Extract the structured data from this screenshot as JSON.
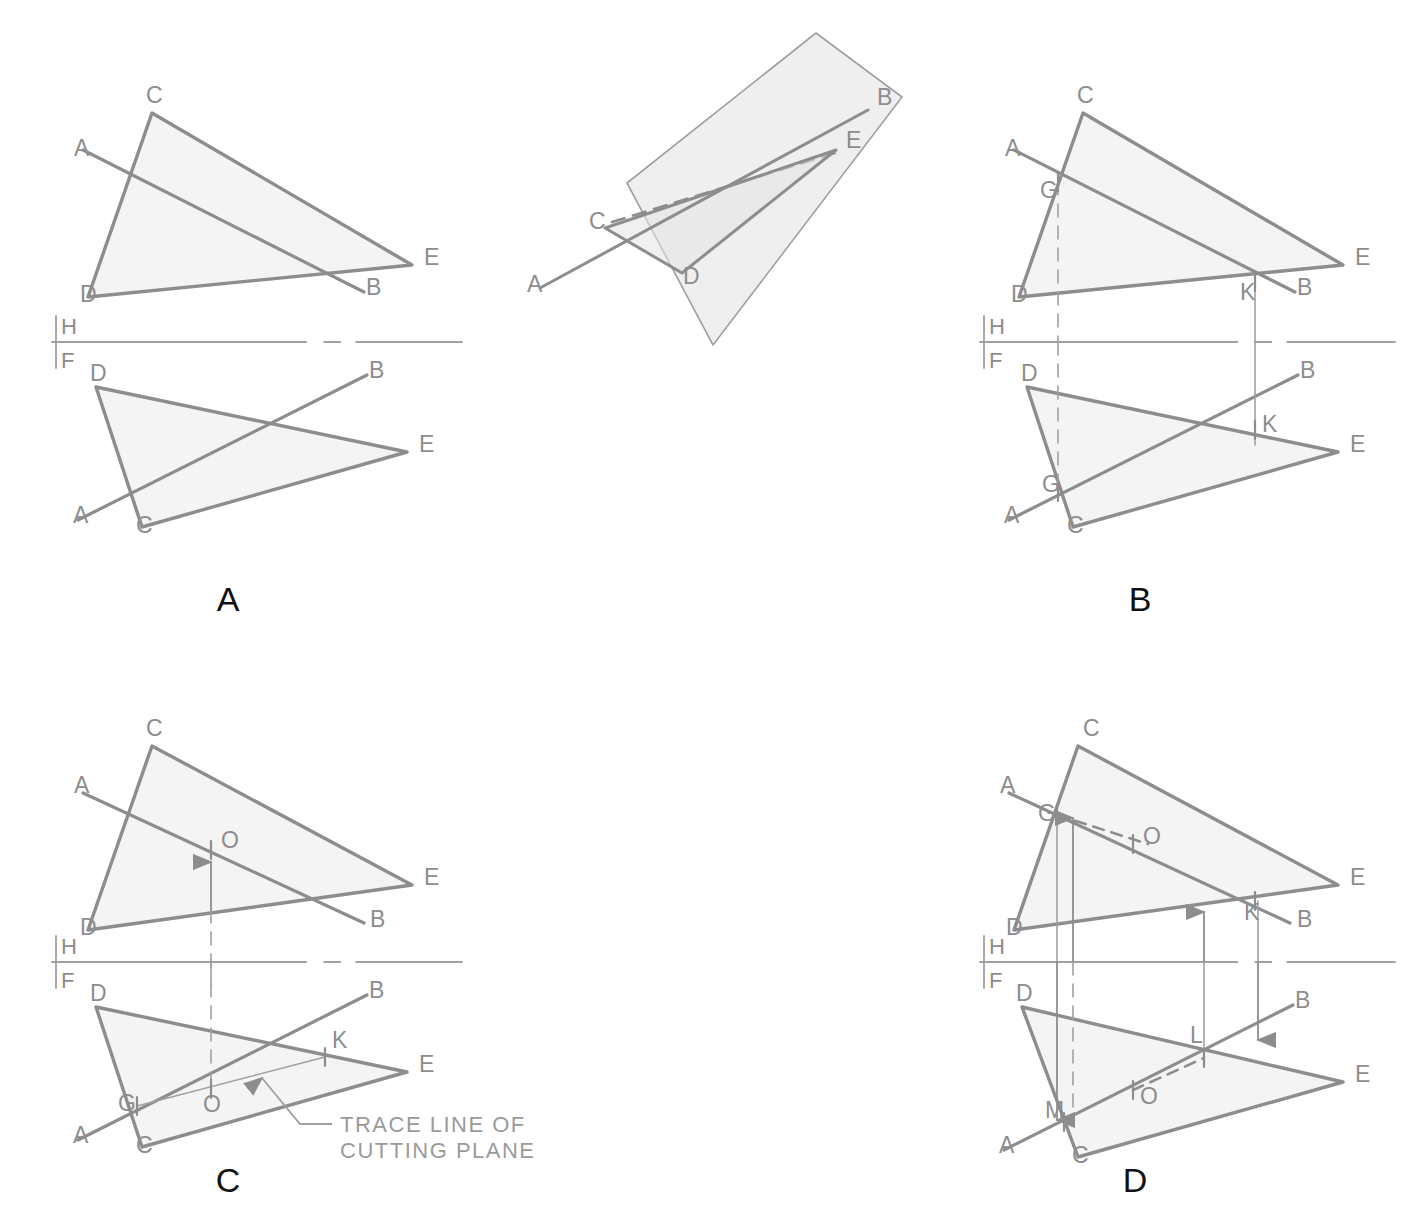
{
  "figure": {
    "stroke_color": "#8d8d8d",
    "thin_stroke_color": "#a0a0a0",
    "fill_color": "#f4f4f4",
    "plane_fill_color": "#efefef",
    "label_color": "#8d8d8d",
    "panel_label_color": "#111111",
    "background": "#ffffff"
  },
  "panels": [
    {
      "id": "panel-a",
      "label": "A",
      "label_pos": {
        "x": 228,
        "y": 611
      },
      "reference_line": {
        "h": "H",
        "f": "F",
        "y": 342,
        "x1": 52,
        "x2": 462
      },
      "top_view": {
        "name": "horizontal-view",
        "vertices": {
          "C": {
            "x": 152,
            "y": 113
          },
          "D": {
            "x": 88,
            "y": 297
          },
          "E": {
            "x": 412,
            "y": 265
          }
        },
        "line_ab": {
          "A": {
            "x": 83,
            "y": 150
          },
          "B": {
            "x": 364,
            "y": 292
          }
        },
        "labels": [
          {
            "t": "C",
            "x": 146,
            "y": 103
          },
          {
            "t": "A",
            "x": 74,
            "y": 156
          },
          {
            "t": "D",
            "x": 80,
            "y": 302
          },
          {
            "t": "E",
            "x": 424,
            "y": 265
          },
          {
            "t": "B",
            "x": 366,
            "y": 295
          }
        ]
      },
      "front_view": {
        "name": "frontal-view",
        "vertices": {
          "D": {
            "x": 96,
            "y": 387
          },
          "C": {
            "x": 142,
            "y": 527
          },
          "E": {
            "x": 407,
            "y": 452
          }
        },
        "line_ab": {
          "A": {
            "x": 78,
            "y": 520
          },
          "B": {
            "x": 367,
            "y": 375
          }
        },
        "labels": [
          {
            "t": "D",
            "x": 90,
            "y": 381
          },
          {
            "t": "B",
            "x": 369,
            "y": 378
          },
          {
            "t": "E",
            "x": 419,
            "y": 452
          },
          {
            "t": "A",
            "x": 73,
            "y": 523
          },
          {
            "t": "C",
            "x": 136,
            "y": 533
          }
        ]
      }
    },
    {
      "id": "panel-b",
      "label": "B",
      "label_pos": {
        "x": 1140,
        "y": 611
      },
      "reference_line": {
        "h": "H",
        "f": "F",
        "y": 342,
        "x1": 980,
        "x2": 1395
      },
      "top_view": {
        "name": "horizontal-view",
        "vertices": {
          "C": {
            "x": 1083,
            "y": 113
          },
          "D": {
            "x": 1019,
            "y": 297
          },
          "E": {
            "x": 1343,
            "y": 265
          }
        },
        "line_ab": {
          "A": {
            "x": 1014,
            "y": 150
          },
          "B": {
            "x": 1295,
            "y": 292
          }
        },
        "pierce_points": [
          {
            "t": "G",
            "x": 1058,
            "y": 182,
            "label_x": 1040,
            "label_y": 198
          },
          {
            "t": "K",
            "x": 1255,
            "y": 282,
            "label_x": 1240,
            "label_y": 300
          }
        ],
        "projectors": [
          {
            "x": 1058,
            "y1": 182,
            "y2": 342,
            "style": "dashed"
          },
          {
            "x": 1255,
            "y1": 282,
            "y2": 342,
            "style": "solid"
          }
        ],
        "labels": [
          {
            "t": "C",
            "x": 1077,
            "y": 103
          },
          {
            "t": "A",
            "x": 1005,
            "y": 156
          },
          {
            "t": "D",
            "x": 1011,
            "y": 302
          },
          {
            "t": "E",
            "x": 1355,
            "y": 265
          },
          {
            "t": "B",
            "x": 1297,
            "y": 295
          }
        ]
      },
      "front_view": {
        "name": "frontal-view",
        "vertices": {
          "D": {
            "x": 1027,
            "y": 387
          },
          "C": {
            "x": 1073,
            "y": 527
          },
          "E": {
            "x": 1338,
            "y": 452
          }
        },
        "line_ab": {
          "A": {
            "x": 1009,
            "y": 520
          },
          "B": {
            "x": 1298,
            "y": 375
          }
        },
        "marks": [
          {
            "t": "G",
            "x": 1058,
            "y": 492,
            "label_x": 1042,
            "label_y": 492
          },
          {
            "t": "K",
            "x": 1255,
            "y": 430,
            "label_x": 1262,
            "label_y": 432
          }
        ],
        "projectors": [
          {
            "x": 1058,
            "y1": 342,
            "y2": 500,
            "style": "dashed"
          },
          {
            "x": 1255,
            "y1": 342,
            "y2": 445,
            "style": "solid"
          }
        ],
        "labels": [
          {
            "t": "D",
            "x": 1021,
            "y": 381
          },
          {
            "t": "B",
            "x": 1300,
            "y": 378
          },
          {
            "t": "E",
            "x": 1350,
            "y": 452
          },
          {
            "t": "A",
            "x": 1004,
            "y": 523
          },
          {
            "t": "C",
            "x": 1067,
            "y": 533
          }
        ]
      }
    },
    {
      "id": "panel-c",
      "label": "C",
      "label_pos": {
        "x": 228,
        "y": 1192
      },
      "reference_line": {
        "h": "H",
        "f": "F",
        "y": 962,
        "x1": 52,
        "x2": 462
      },
      "top_view": {
        "name": "horizontal-view",
        "vertices": {
          "C": {
            "x": 152,
            "y": 746
          },
          "D": {
            "x": 88,
            "y": 930
          },
          "E": {
            "x": 412,
            "y": 885
          }
        },
        "line_ab": {
          "A": {
            "x": 83,
            "y": 793
          },
          "B": {
            "x": 364,
            "y": 923
          }
        },
        "point_o": {
          "x": 211,
          "y": 850,
          "label_x": 221,
          "label_y": 848
        },
        "arrow_up": {
          "x": 211,
          "y1": 910,
          "y2": 862
        },
        "projector": {
          "x": 211,
          "y1": 910,
          "y2": 985,
          "style": "dashed"
        },
        "labels": [
          {
            "t": "C",
            "x": 146,
            "y": 736
          },
          {
            "t": "A",
            "x": 74,
            "y": 793
          },
          {
            "t": "D",
            "x": 80,
            "y": 935
          },
          {
            "t": "E",
            "x": 424,
            "y": 885
          },
          {
            "t": "B",
            "x": 370,
            "y": 927
          },
          {
            "t": "O",
            "x": 221,
            "y": 848
          }
        ]
      },
      "front_view": {
        "name": "frontal-view",
        "vertices": {
          "D": {
            "x": 96,
            "y": 1007
          },
          "C": {
            "x": 142,
            "y": 1147
          },
          "E": {
            "x": 407,
            "y": 1072
          }
        },
        "line_ab": {
          "A": {
            "x": 78,
            "y": 1140
          },
          "B": {
            "x": 367,
            "y": 995
          }
        },
        "trace_line": {
          "G": {
            "x": 137,
            "y": 1106
          },
          "K": {
            "x": 325,
            "y": 1057
          }
        },
        "point_o": {
          "x": 211,
          "y": 1089,
          "label_x": 205,
          "label_y": 1110
        },
        "marks": [
          {
            "t": "G",
            "x": 137,
            "y": 1106,
            "label_x": 118,
            "label_y": 1111
          },
          {
            "t": "K",
            "x": 325,
            "y": 1057,
            "label_x": 332,
            "label_y": 1048
          },
          {
            "t": "O",
            "x": 211,
            "y": 1089,
            "label_x": 203,
            "label_y": 1112
          }
        ],
        "projector": {
          "x": 211,
          "y1": 962,
          "y2": 1089,
          "style": "dashed"
        },
        "annotation": {
          "text_line1": "TRACE  LINE  OF",
          "text_line2": "CUTTING PLANE",
          "text_x": 340,
          "text_y1": 1132,
          "text_y2": 1158,
          "leader": {
            "x1": 332,
            "y1": 1124,
            "x2": 300,
            "y2": 1124,
            "x3": 262,
            "y3": 1078
          },
          "arrow_tip": {
            "x": 257,
            "y": 1072
          }
        },
        "labels": [
          {
            "t": "D",
            "x": 90,
            "y": 1001
          },
          {
            "t": "B",
            "x": 369,
            "y": 998
          },
          {
            "t": "E",
            "x": 419,
            "y": 1072
          },
          {
            "t": "A",
            "x": 73,
            "y": 1143
          },
          {
            "t": "C",
            "x": 136,
            "y": 1153
          }
        ]
      }
    },
    {
      "id": "panel-d",
      "label": "D",
      "label_pos": {
        "x": 1135,
        "y": 1192
      },
      "reference_line": {
        "h": "H",
        "f": "F",
        "y": 962,
        "x1": 980,
        "x2": 1395
      },
      "top_view": {
        "name": "horizontal-view",
        "vertices": {
          "C": {
            "x": 1078,
            "y": 746
          },
          "D": {
            "x": 1014,
            "y": 930
          },
          "E": {
            "x": 1338,
            "y": 885
          }
        },
        "line_ab": {
          "A": {
            "x": 1009,
            "y": 793
          },
          "B": {
            "x": 1290,
            "y": 923
          }
        },
        "marks": [
          {
            "t": "G",
            "x": 1057,
            "y": 815,
            "label_x": 1038,
            "label_y": 821
          },
          {
            "t": "O",
            "x": 1133,
            "y": 844,
            "label_x": 1143,
            "label_y": 844
          },
          {
            "t": "K",
            "x": 1255,
            "y": 901,
            "label_x": 1244,
            "label_y": 920
          }
        ],
        "dashed_go": {
          "x1": 1057,
          "y1": 815,
          "x2": 1148,
          "y2": 844
        },
        "arrows_up": [
          {
            "x": 1073,
            "y1": 962,
            "y2": 818
          },
          {
            "x": 1204,
            "y1": 962,
            "y2": 912
          }
        ],
        "projectors": [
          {
            "x": 1057,
            "y1": 815,
            "y2": 962,
            "style": "solid"
          },
          {
            "x": 1258,
            "y1": 901,
            "y2": 962,
            "style": "solid"
          }
        ],
        "labels": [
          {
            "t": "C",
            "x": 1083,
            "y": 736
          },
          {
            "t": "A",
            "x": 1000,
            "y": 793
          },
          {
            "t": "D",
            "x": 1006,
            "y": 935
          },
          {
            "t": "E",
            "x": 1350,
            "y": 885
          },
          {
            "t": "B",
            "x": 1297,
            "y": 927
          }
        ]
      },
      "front_view": {
        "name": "frontal-view",
        "vertices": {
          "D": {
            "x": 1022,
            "y": 1007
          },
          "C": {
            "x": 1078,
            "y": 1157
          },
          "E": {
            "x": 1343,
            "y": 1082
          }
        },
        "line_ab": {
          "A": {
            "x": 1004,
            "y": 1150
          },
          "B": {
            "x": 1293,
            "y": 1005
          }
        },
        "marks": [
          {
            "t": "M",
            "x": 1064,
            "y": 1122,
            "label_x": 1045,
            "label_y": 1118
          },
          {
            "t": "L",
            "x": 1204,
            "y": 1058,
            "label_x": 1190,
            "label_y": 1043
          },
          {
            "t": "O",
            "x": 1133,
            "y": 1090,
            "label_x": 1140,
            "label_y": 1104
          }
        ],
        "dashed_ol": {
          "x1": 1133,
          "y1": 1090,
          "x2": 1204,
          "y2": 1058
        },
        "arrows_down": [
          {
            "x": 1057,
            "y1": 962,
            "y2": 1120
          },
          {
            "x": 1258,
            "y1": 962,
            "y2": 1040
          }
        ],
        "projectors": [
          {
            "x": 1073,
            "y1": 962,
            "y2": 1125,
            "style": "dashed"
          },
          {
            "x": 1204,
            "y1": 962,
            "y2": 1058,
            "style": "solid"
          }
        ],
        "labels": [
          {
            "t": "D",
            "x": 1016,
            "y": 1001
          },
          {
            "t": "B",
            "x": 1295,
            "y": 1008
          },
          {
            "t": "E",
            "x": 1355,
            "y": 1082
          },
          {
            "t": "A",
            "x": 999,
            "y": 1153
          },
          {
            "t": "C",
            "x": 1072,
            "y": 1163
          }
        ]
      }
    }
  ],
  "pictorial": {
    "id": "pictorial-inset",
    "name": "pictorial-plane-and-line",
    "plane": {
      "points": "627,183 816,33 902,97 713,345",
      "fill": "#efefef"
    },
    "triangle": {
      "C": {
        "x": 605,
        "y": 228
      },
      "D": {
        "x": 682,
        "y": 273
      },
      "E": {
        "x": 836,
        "y": 150
      }
    },
    "line_ab": {
      "A": {
        "x": 540,
        "y": 288
      },
      "B": {
        "x": 868,
        "y": 110
      }
    },
    "hidden_edge": {
      "x1": 612,
      "y1": 222,
      "x2": 838,
      "y2": 152
    },
    "labels": [
      {
        "t": "B",
        "x": 877,
        "y": 105
      },
      {
        "t": "E",
        "x": 846,
        "y": 148
      },
      {
        "t": "C",
        "x": 589,
        "y": 229
      },
      {
        "t": "D",
        "x": 683,
        "y": 284
      },
      {
        "t": "A",
        "x": 527,
        "y": 292
      }
    ]
  }
}
